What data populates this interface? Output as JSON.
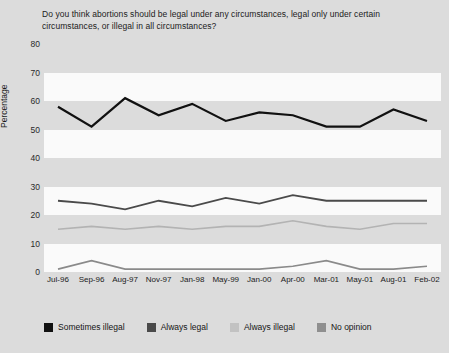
{
  "chart_data": {
    "type": "line",
    "title": "Do you think abortions should be legal under any circumstances, legal only under certain circumstances, or illegal in all circumstances?",
    "xlabel": "",
    "ylabel": "Percentage",
    "ylim": [
      0,
      80
    ],
    "yticks": [
      80,
      70,
      60,
      50,
      40,
      30,
      20,
      10,
      0
    ],
    "grid": false,
    "legend_position": "bottom",
    "categories": [
      "Jul-96",
      "Sep-96",
      "Aug-97",
      "Nov-97",
      "Jan-98",
      "May-99",
      "Jan-00",
      "Apr-00",
      "Mar-01",
      "May-01",
      "Aug-01",
      "Feb-02"
    ],
    "series": [
      {
        "name": "Sometimes illegal",
        "color": "#111111",
        "width": 2.2,
        "values": [
          58,
          51,
          61,
          55,
          59,
          53,
          56,
          55,
          51,
          51,
          57,
          53
        ]
      },
      {
        "name": "Always legal",
        "color": "#4a4a4a",
        "width": 1.8,
        "values": [
          25,
          24,
          22,
          25,
          23,
          26,
          24,
          27,
          25,
          25,
          25,
          25
        ]
      },
      {
        "name": "Always illegal",
        "color": "#b3b3b3",
        "width": 1.6,
        "values": [
          15,
          16,
          15,
          16,
          15,
          16,
          16,
          18,
          16,
          15,
          17,
          17
        ]
      },
      {
        "name": "No opinion",
        "color": "#8a8a8a",
        "width": 1.6,
        "values": [
          1,
          4,
          1,
          1,
          1,
          1,
          1,
          2,
          4,
          1,
          1,
          2
        ]
      }
    ]
  },
  "legend": {
    "items": [
      {
        "label": "Sometimes illegal",
        "color": "#111111"
      },
      {
        "label": "Always legal",
        "color": "#4a4a4a"
      },
      {
        "label": "Always illegal",
        "color": "#c2c2c2"
      },
      {
        "label": "No opinion",
        "color": "#8f8f8f"
      }
    ]
  },
  "bands": {
    "color": "#fafafa",
    "ranges": [
      [
        70,
        60
      ],
      [
        50,
        40
      ],
      [
        30,
        20
      ],
      [
        10,
        0
      ]
    ]
  }
}
